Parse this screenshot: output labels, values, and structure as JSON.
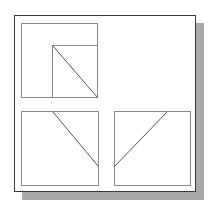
{
  "drawing": {
    "type": "orthographic-projection",
    "colors": {
      "background": "#ffffff",
      "frame_border": "#3a3a3a",
      "shadow": "#a9a9a9",
      "view_line": "#8a8a8a",
      "edge_line": "#555555"
    },
    "views": [
      {
        "name": "top-left-view",
        "box": {
          "x": 21,
          "y": 23,
          "w": 76,
          "h": 74
        },
        "lines": [
          {
            "x1": 52,
            "y1": 45,
            "x2": 52,
            "y2": 97
          },
          {
            "x1": 52,
            "y1": 45,
            "x2": 97,
            "y2": 45
          },
          {
            "x1": 52,
            "y1": 45,
            "x2": 97,
            "y2": 97
          }
        ]
      },
      {
        "name": "bottom-left-view",
        "box": {
          "x": 21,
          "y": 111,
          "w": 77,
          "h": 74
        },
        "lines": [
          {
            "x1": 52,
            "y1": 111,
            "x2": 98,
            "y2": 166
          }
        ]
      },
      {
        "name": "bottom-right-view",
        "box": {
          "x": 114,
          "y": 111,
          "w": 76,
          "h": 74
        },
        "lines": [
          {
            "x1": 167,
            "y1": 111,
            "x2": 114,
            "y2": 166
          }
        ]
      }
    ]
  }
}
